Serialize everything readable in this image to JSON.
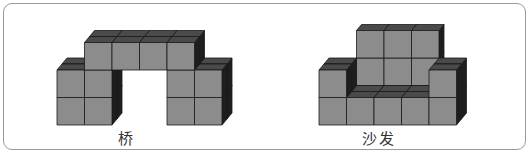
{
  "figures": [
    {
      "name": "bridge",
      "label": "桥",
      "label_x": 120,
      "description": "Bridge built from unit cubes: two 2x2 pillars joined by a 4-cube beam on top, 2 cubes deep"
    },
    {
      "name": "sofa",
      "label": "沙发",
      "label_x": 364,
      "description": "Sofa built from unit cubes: 5-cube base row, 3x2 back, one-cube armrests on each side"
    }
  ],
  "colors": {
    "front": "#8c8c8c",
    "top": "#4a4a4a",
    "side": "#1e1e1e",
    "edge": "#1a1a1a",
    "frame": "#9a9a9a"
  },
  "cube": {
    "w": 27.5,
    "dx": 5,
    "dy": 6
  }
}
